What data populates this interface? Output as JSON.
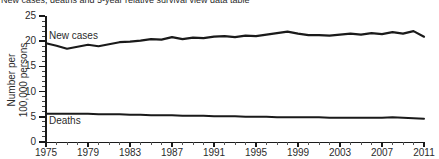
{
  "title": "New cases, deaths and 5-year relative survival view data table",
  "axis": {
    "ylabel_line1": "Number per",
    "ylabel_line2": "100,000 persons",
    "xlabel": ""
  },
  "series_labels": {
    "new_cases": "New cases",
    "deaths": "Deaths"
  },
  "chart_data": {
    "type": "line",
    "title": "New cases, deaths and 5-year relative survival view data table",
    "xlabel": "",
    "ylabel": "Number per 100,000 persons",
    "xlim": [
      1975,
      2011
    ],
    "ylim": [
      0,
      25
    ],
    "ytick_labels": [
      "0",
      "5",
      "10",
      "15",
      "20",
      "25"
    ],
    "ytick_values": [
      0,
      5,
      10,
      15,
      20,
      25
    ],
    "xtick_labels": [
      "1975",
      "1979",
      "1983",
      "1987",
      "1991",
      "1995",
      "1999",
      "2003",
      "2007",
      "2011"
    ],
    "xtick_values": [
      1975,
      1979,
      1983,
      1987,
      1991,
      1995,
      1999,
      2003,
      2007,
      2011
    ],
    "minor_xticks_every": 1,
    "grid": false,
    "legend": "inline-labels",
    "line_color": "#1a1a1a",
    "x": [
      1975,
      1976,
      1977,
      1978,
      1979,
      1980,
      1981,
      1982,
      1983,
      1984,
      1985,
      1986,
      1987,
      1988,
      1989,
      1990,
      1991,
      1992,
      1993,
      1994,
      1995,
      1996,
      1997,
      1998,
      1999,
      2000,
      2001,
      2002,
      2003,
      2004,
      2005,
      2006,
      2007,
      2008,
      2009,
      2010,
      2011
    ],
    "series": [
      {
        "name": "New cases",
        "values": [
          19.6,
          19.1,
          18.5,
          18.9,
          19.3,
          19.0,
          19.4,
          19.8,
          19.9,
          20.1,
          20.4,
          20.3,
          20.8,
          20.4,
          20.7,
          20.6,
          20.9,
          21.0,
          20.8,
          21.1,
          21.0,
          21.3,
          21.6,
          21.9,
          21.5,
          21.2,
          21.2,
          21.1,
          21.3,
          21.5,
          21.3,
          21.6,
          21.4,
          21.8,
          21.5,
          22.0,
          20.9
        ]
      },
      {
        "name": "Deaths",
        "values": [
          5.6,
          5.6,
          5.6,
          5.6,
          5.6,
          5.5,
          5.5,
          5.5,
          5.4,
          5.4,
          5.3,
          5.3,
          5.3,
          5.2,
          5.2,
          5.2,
          5.1,
          5.1,
          5.1,
          5.0,
          5.0,
          5.0,
          4.9,
          4.9,
          4.9,
          4.9,
          4.9,
          4.8,
          4.8,
          4.8,
          4.8,
          4.8,
          4.8,
          4.9,
          4.8,
          4.7,
          4.6
        ]
      }
    ]
  }
}
